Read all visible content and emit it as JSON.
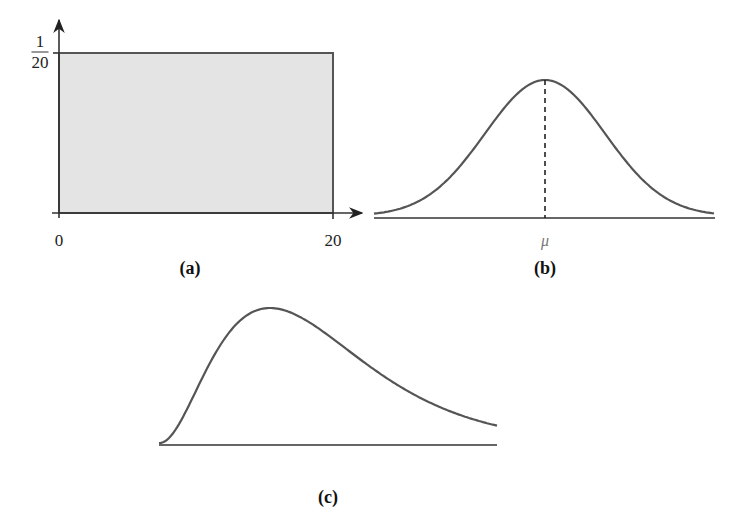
{
  "chart_data": [
    {
      "id": "a",
      "type": "area",
      "title": "Uniform distribution",
      "panel_label": "(a)",
      "xlabel": "",
      "ylabel": "",
      "x_ticks": [
        "0",
        "20"
      ],
      "y_ticks": [
        {
          "num": "1",
          "den": "20"
        }
      ],
      "x": [
        0,
        0,
        20,
        20
      ],
      "y": [
        0,
        0.05,
        0.05,
        0
      ],
      "xlim": [
        0,
        20
      ],
      "ylim": [
        0,
        0.05
      ],
      "fill_color": "#e4e4e4",
      "grid": false,
      "px": {
        "x0": 59,
        "x1": 333,
        "y0": 213,
        "ytop": 53,
        "axis_x_start": 52,
        "axis_x_end": 362,
        "axis_y_top": 20,
        "axis_y_bottom": 218
      }
    },
    {
      "id": "b",
      "type": "line",
      "title": "Normal (bell-shaped) distribution",
      "panel_label": "(b)",
      "x_ticks": [
        "μ"
      ],
      "annotation": "dashed vertical line at mean μ",
      "shape": "gaussian",
      "grid": false,
      "px": {
        "x_start": 374,
        "x_end": 715,
        "baseline": 218,
        "peak_x": 545,
        "peak_y": 80,
        "sigma": 60
      }
    },
    {
      "id": "c",
      "type": "line",
      "title": "Right-skewed distribution",
      "panel_label": "(c)",
      "x_ticks": [],
      "shape": "right-skewed",
      "grid": false,
      "px": {
        "x_start": 159,
        "x_end": 497,
        "baseline": 445,
        "peak_x": 270,
        "peak_y": 308,
        "k": 3.2
      }
    }
  ],
  "labels": {
    "a_x0": "0",
    "a_x20": "20",
    "a_y_num": "1",
    "a_y_den": "20",
    "b_mu": "μ",
    "panel_a": "(a)",
    "panel_b": "(b)",
    "panel_c": "(c)"
  },
  "colors": {
    "stroke": "#555555",
    "axis": "#333333",
    "fill": "#e4e4e4"
  }
}
